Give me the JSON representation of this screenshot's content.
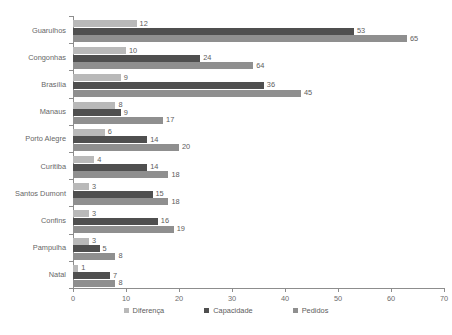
{
  "chart_data": {
    "type": "bar",
    "orientation": "horizontal",
    "title": "",
    "xlabel": "",
    "ylabel": "",
    "xlim": [
      0,
      70
    ],
    "xticks": [
      0,
      10,
      20,
      30,
      40,
      50,
      60,
      70
    ],
    "grid": false,
    "legend_position": "bottom",
    "categories": [
      "Guarulhos",
      "Congonhas",
      "Brasília",
      "Manaus",
      "Porto Alegre",
      "Curitiba",
      "Santos Dumont",
      "Confins",
      "Pampulha",
      "Natal"
    ],
    "series": [
      {
        "name": "Diferença",
        "color": "#b9b9b9",
        "values": [
          12,
          10,
          9,
          8,
          6,
          4,
          3,
          3,
          3,
          1
        ],
        "bar_lengths": [
          12,
          10,
          9,
          8,
          6,
          4,
          3,
          3,
          3,
          1
        ]
      },
      {
        "name": "Capacidade",
        "color": "#4f4f4f",
        "values": [
          53,
          24,
          36,
          9,
          14,
          14,
          15,
          16,
          5,
          7
        ],
        "bar_lengths": [
          53,
          24,
          36,
          9,
          14,
          14,
          15,
          16,
          5,
          7
        ]
      },
      {
        "name": "Pedidos",
        "color": "#8f8f8f",
        "values": [
          65,
          64,
          45,
          17,
          20,
          18,
          18,
          19,
          8,
          8
        ],
        "bar_lengths": [
          63,
          34,
          43,
          17,
          20,
          18,
          18,
          19,
          8,
          8
        ]
      }
    ]
  },
  "legend": {
    "items": [
      {
        "label": "Diferença",
        "color": "#b9b9b9"
      },
      {
        "label": "Capacidade",
        "color": "#4f4f4f"
      },
      {
        "label": "Pedidos",
        "color": "#8f8f8f"
      }
    ]
  }
}
